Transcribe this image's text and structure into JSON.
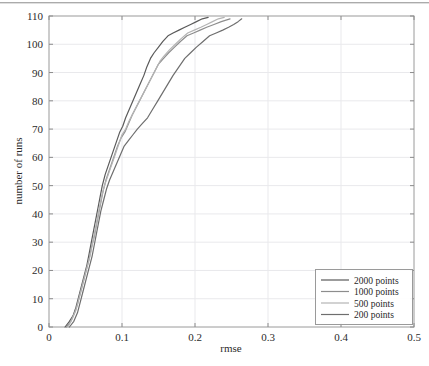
{
  "chart_data": {
    "type": "line",
    "title": "",
    "xlabel": "rmse",
    "ylabel": "number of runs",
    "xlim": [
      0,
      0.5
    ],
    "ylim": [
      0,
      110
    ],
    "xticks": [
      0,
      0.1,
      0.2,
      0.3,
      0.4,
      0.5
    ],
    "xticklabels": [
      "0",
      "0.1",
      "0.2",
      "0.3",
      "0.4",
      "0.5"
    ],
    "yticks": [
      0,
      10,
      20,
      30,
      40,
      50,
      60,
      70,
      80,
      90,
      100,
      110
    ],
    "yticklabels": [
      "0",
      "10",
      "20",
      "30",
      "40",
      "50",
      "60",
      "70",
      "80",
      "90",
      "100",
      "110"
    ],
    "grid": true,
    "legend_position": "lower right",
    "series": [
      {
        "name": "2000 points",
        "color": "#5a5a5a",
        "width": 1.2,
        "points": [
          [
            0.022,
            0
          ],
          [
            0.028,
            2
          ],
          [
            0.033,
            4
          ],
          [
            0.037,
            7
          ],
          [
            0.04,
            10
          ],
          [
            0.044,
            14
          ],
          [
            0.048,
            18
          ],
          [
            0.052,
            22
          ],
          [
            0.055,
            26
          ],
          [
            0.058,
            30
          ],
          [
            0.061,
            34
          ],
          [
            0.064,
            38
          ],
          [
            0.067,
            42
          ],
          [
            0.07,
            46
          ],
          [
            0.073,
            50
          ],
          [
            0.077,
            54
          ],
          [
            0.081,
            57
          ],
          [
            0.085,
            60
          ],
          [
            0.089,
            63
          ],
          [
            0.093,
            66
          ],
          [
            0.097,
            69
          ],
          [
            0.101,
            71
          ],
          [
            0.105,
            74
          ],
          [
            0.11,
            77
          ],
          [
            0.115,
            80
          ],
          [
            0.12,
            83
          ],
          [
            0.125,
            86
          ],
          [
            0.13,
            89
          ],
          [
            0.134,
            92
          ],
          [
            0.139,
            95
          ],
          [
            0.144,
            97
          ],
          [
            0.15,
            99
          ],
          [
            0.156,
            101
          ],
          [
            0.163,
            103
          ],
          [
            0.17,
            104
          ],
          [
            0.178,
            105
          ],
          [
            0.186,
            106
          ],
          [
            0.194,
            107
          ],
          [
            0.202,
            108
          ],
          [
            0.21,
            109
          ],
          [
            0.218,
            109.5
          ]
        ]
      },
      {
        "name": "1000 points",
        "color": "#8d8d8d",
        "width": 1.2,
        "points": [
          [
            0.024,
            0
          ],
          [
            0.03,
            2
          ],
          [
            0.035,
            5
          ],
          [
            0.039,
            8
          ],
          [
            0.043,
            12
          ],
          [
            0.047,
            16
          ],
          [
            0.051,
            20
          ],
          [
            0.055,
            24
          ],
          [
            0.058,
            28
          ],
          [
            0.062,
            32
          ],
          [
            0.065,
            36
          ],
          [
            0.068,
            40
          ],
          [
            0.071,
            44
          ],
          [
            0.074,
            48
          ],
          [
            0.078,
            52
          ],
          [
            0.082,
            55
          ],
          [
            0.086,
            58
          ],
          [
            0.09,
            61
          ],
          [
            0.094,
            64
          ],
          [
            0.099,
            67
          ],
          [
            0.104,
            69
          ],
          [
            0.109,
            72
          ],
          [
            0.114,
            75
          ],
          [
            0.12,
            78
          ],
          [
            0.126,
            81
          ],
          [
            0.132,
            84
          ],
          [
            0.138,
            87
          ],
          [
            0.144,
            90
          ],
          [
            0.15,
            93
          ],
          [
            0.157,
            95
          ],
          [
            0.164,
            97
          ],
          [
            0.172,
            99
          ],
          [
            0.18,
            101
          ],
          [
            0.189,
            103
          ],
          [
            0.198,
            104
          ],
          [
            0.207,
            105
          ],
          [
            0.216,
            106
          ],
          [
            0.226,
            107
          ],
          [
            0.236,
            108
          ],
          [
            0.248,
            109
          ]
        ]
      },
      {
        "name": "500 points",
        "color": "#b4b4b4",
        "width": 1.2,
        "points": [
          [
            0.026,
            0
          ],
          [
            0.032,
            3
          ],
          [
            0.037,
            6
          ],
          [
            0.041,
            10
          ],
          [
            0.045,
            14
          ],
          [
            0.049,
            18
          ],
          [
            0.053,
            22
          ],
          [
            0.057,
            26
          ],
          [
            0.06,
            30
          ],
          [
            0.063,
            34
          ],
          [
            0.066,
            38
          ],
          [
            0.069,
            42
          ],
          [
            0.072,
            46
          ],
          [
            0.076,
            50
          ],
          [
            0.08,
            53
          ],
          [
            0.084,
            56
          ],
          [
            0.088,
            59
          ],
          [
            0.092,
            62
          ],
          [
            0.096,
            65
          ],
          [
            0.1,
            68
          ],
          [
            0.105,
            70
          ],
          [
            0.11,
            73
          ],
          [
            0.116,
            76
          ],
          [
            0.122,
            79
          ],
          [
            0.128,
            82
          ],
          [
            0.134,
            85
          ],
          [
            0.14,
            88
          ],
          [
            0.146,
            91
          ],
          [
            0.152,
            94
          ],
          [
            0.158,
            96
          ],
          [
            0.165,
            98
          ],
          [
            0.173,
            100
          ],
          [
            0.181,
            102
          ],
          [
            0.19,
            104
          ],
          [
            0.199,
            105
          ],
          [
            0.208,
            106
          ],
          [
            0.216,
            107
          ],
          [
            0.224,
            108
          ],
          [
            0.232,
            109
          ],
          [
            0.24,
            109.5
          ]
        ]
      },
      {
        "name": "200 points",
        "color": "#6e6e6e",
        "width": 1.2,
        "points": [
          [
            0.028,
            0
          ],
          [
            0.034,
            2
          ],
          [
            0.039,
            5
          ],
          [
            0.043,
            9
          ],
          [
            0.047,
            13
          ],
          [
            0.051,
            17
          ],
          [
            0.055,
            21
          ],
          [
            0.059,
            25
          ],
          [
            0.062,
            29
          ],
          [
            0.065,
            33
          ],
          [
            0.068,
            37
          ],
          [
            0.071,
            41
          ],
          [
            0.075,
            45
          ],
          [
            0.079,
            49
          ],
          [
            0.083,
            52
          ],
          [
            0.088,
            55
          ],
          [
            0.093,
            58
          ],
          [
            0.098,
            61
          ],
          [
            0.103,
            64
          ],
          [
            0.109,
            66
          ],
          [
            0.115,
            68
          ],
          [
            0.121,
            70
          ],
          [
            0.128,
            72
          ],
          [
            0.135,
            74
          ],
          [
            0.142,
            77
          ],
          [
            0.149,
            80
          ],
          [
            0.156,
            83
          ],
          [
            0.163,
            86
          ],
          [
            0.17,
            89
          ],
          [
            0.178,
            92
          ],
          [
            0.186,
            95
          ],
          [
            0.194,
            97
          ],
          [
            0.202,
            99
          ],
          [
            0.211,
            101
          ],
          [
            0.22,
            103
          ],
          [
            0.229,
            104
          ],
          [
            0.238,
            105
          ],
          [
            0.246,
            106
          ],
          [
            0.253,
            107
          ],
          [
            0.259,
            108
          ],
          [
            0.264,
            109
          ]
        ]
      }
    ]
  },
  "legend": {
    "items": [
      {
        "label": "2000 points"
      },
      {
        "label": "1000 points"
      },
      {
        "label": "500 points"
      },
      {
        "label": "200 points"
      }
    ]
  }
}
